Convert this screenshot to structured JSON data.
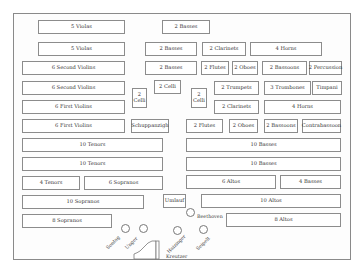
{
  "colors": {
    "border": "#8c8c8c",
    "text": "#333333",
    "background": "#ffffff"
  },
  "sections": [
    {
      "label": "5 Violas",
      "x": 38,
      "y": 20,
      "w": 87,
      "h": 14
    },
    {
      "label": "2 Basses",
      "x": 162,
      "y": 20,
      "w": 48,
      "h": 14
    },
    {
      "label": "5 Violas",
      "x": 38,
      "y": 42,
      "w": 87,
      "h": 14
    },
    {
      "label": "2 Basses",
      "x": 145,
      "y": 42,
      "w": 52,
      "h": 14
    },
    {
      "label": "2 Clarinets",
      "x": 202,
      "y": 42,
      "w": 44,
      "h": 14
    },
    {
      "label": "4 Horns",
      "x": 250,
      "y": 42,
      "w": 72,
      "h": 14
    },
    {
      "label": "6 Second Violins",
      "x": 22,
      "y": 61,
      "w": 103,
      "h": 14
    },
    {
      "label": "2 Basses",
      "x": 145,
      "y": 61,
      "w": 52,
      "h": 14
    },
    {
      "label": "2 Flutes",
      "x": 201,
      "y": 61,
      "w": 28,
      "h": 14
    },
    {
      "label": "2 Oboes",
      "x": 232,
      "y": 61,
      "w": 26,
      "h": 14
    },
    {
      "label": "2 Bassoons",
      "x": 262,
      "y": 61,
      "w": 45,
      "h": 14
    },
    {
      "label": "2 Percussion",
      "x": 309,
      "y": 61,
      "w": 33,
      "h": 14
    },
    {
      "label": "6 Second Violins",
      "x": 22,
      "y": 81,
      "w": 103,
      "h": 14
    },
    {
      "label": "2 Celli",
      "x": 154,
      "y": 80,
      "w": 27,
      "h": 14
    },
    {
      "label": "2 Trumpets",
      "x": 214,
      "y": 81,
      "w": 45,
      "h": 14
    },
    {
      "label": "3 Trombones",
      "x": 264,
      "y": 81,
      "w": 47,
      "h": 14
    },
    {
      "label": "Timpani",
      "x": 312,
      "y": 81,
      "w": 30,
      "h": 14
    },
    {
      "label": "6 First Violins",
      "x": 22,
      "y": 100,
      "w": 103,
      "h": 14
    },
    {
      "label": "2 Clarinets",
      "x": 214,
      "y": 100,
      "w": 45,
      "h": 14
    },
    {
      "label": "4 Horns",
      "x": 264,
      "y": 100,
      "w": 77,
      "h": 14
    },
    {
      "label": "6 First Violins",
      "x": 22,
      "y": 119,
      "w": 103,
      "h": 14
    },
    {
      "label": "Schuppanzigh",
      "x": 131,
      "y": 119,
      "w": 38,
      "h": 14
    },
    {
      "label": "2 Flutes",
      "x": 186,
      "y": 119,
      "w": 37,
      "h": 14
    },
    {
      "label": "2 Oboes",
      "x": 229,
      "y": 119,
      "w": 29,
      "h": 14
    },
    {
      "label": "2 Bassoons",
      "x": 264,
      "y": 119,
      "w": 34,
      "h": 14
    },
    {
      "label": "Contrabassoon",
      "x": 302,
      "y": 119,
      "w": 39,
      "h": 14
    },
    {
      "label": "10 Tenors",
      "x": 22,
      "y": 138,
      "w": 141,
      "h": 14
    },
    {
      "label": "10 Basses",
      "x": 186,
      "y": 138,
      "w": 155,
      "h": 14
    },
    {
      "label": "10 Tenors",
      "x": 22,
      "y": 157,
      "w": 141,
      "h": 14
    },
    {
      "label": "10 Basses",
      "x": 186,
      "y": 157,
      "w": 155,
      "h": 14
    },
    {
      "label": "4 Tenors",
      "x": 22,
      "y": 176,
      "w": 58,
      "h": 14
    },
    {
      "label": "6 Sopranos",
      "x": 84,
      "y": 176,
      "w": 79,
      "h": 14
    },
    {
      "label": "6 Altos",
      "x": 186,
      "y": 175,
      "w": 90,
      "h": 14
    },
    {
      "label": "4 Basses",
      "x": 280,
      "y": 175,
      "w": 61,
      "h": 14
    },
    {
      "label": "10 Sopranos",
      "x": 22,
      "y": 195,
      "w": 122,
      "h": 14
    },
    {
      "label": "Umlauf",
      "x": 163,
      "y": 194,
      "w": 23,
      "h": 14
    },
    {
      "label": "10 Altos",
      "x": 201,
      "y": 194,
      "w": 140,
      "h": 14
    },
    {
      "label": "8 Sopranos",
      "x": 22,
      "y": 214,
      "w": 90,
      "h": 14
    },
    {
      "label": "8 Altos",
      "x": 226,
      "y": 213,
      "w": 115,
      "h": 14
    }
  ],
  "tall_sections": [
    {
      "line1": "2",
      "line2": "Celli",
      "x": 132,
      "y": 88,
      "w": 15,
      "h": 20
    },
    {
      "line1": "2",
      "line2": "Celli",
      "x": 191,
      "y": 88,
      "w": 16,
      "h": 20
    }
  ],
  "soloists": [
    {
      "name": "Sontag",
      "cx": 125,
      "cy": 228,
      "lx": 107,
      "ly": 246,
      "rot": true
    },
    {
      "name": "Unger",
      "cx": 143,
      "cy": 228,
      "lx": 126,
      "ly": 246,
      "rot": true
    },
    {
      "name": "Haizinger",
      "cx": 177,
      "cy": 230,
      "lx": 168,
      "ly": 250,
      "rot": true
    },
    {
      "name": "Seipelt",
      "cx": 203,
      "cy": 229,
      "lx": 197,
      "ly": 247,
      "rot": true
    },
    {
      "name": "Beethoven",
      "cx": 190,
      "cy": 212,
      "lx": 197,
      "ly": 214,
      "rot": false
    }
  ],
  "piano": {
    "label": "Kreutzer",
    "x": 132,
    "y": 240,
    "w": 30,
    "h": 20,
    "label_x": 166,
    "label_y": 254
  }
}
